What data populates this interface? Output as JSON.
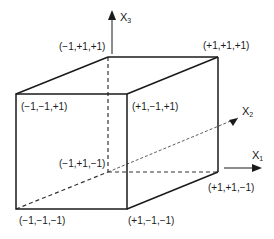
{
  "diagram": {
    "type": "cube-factorial-design",
    "axes": [
      {
        "id": "x1",
        "label": "X",
        "sub": "1"
      },
      {
        "id": "x2",
        "label": "X",
        "sub": "2"
      },
      {
        "id": "x3",
        "label": "X",
        "sub": "3"
      }
    ],
    "vertices": [
      {
        "id": "v_mpp",
        "label": "(−1,+1,+1)"
      },
      {
        "id": "v_ppp",
        "label": "(+1,+1,+1)"
      },
      {
        "id": "v_mmp",
        "label": "(−1,−1,+1)"
      },
      {
        "id": "v_pmp",
        "label": "(+1,−1,+1)"
      },
      {
        "id": "v_mpm",
        "label": "(−1,+1,−1)"
      },
      {
        "id": "v_ppm",
        "label": "(+1,+1,−1)"
      },
      {
        "id": "v_mmm",
        "label": "(−1,−1,−1)"
      },
      {
        "id": "v_pmm",
        "label": "(+1,−1,−1)"
      }
    ],
    "colors": {
      "line": "#1a1a1a",
      "hidden": "#333333",
      "background": "#ffffff"
    }
  }
}
